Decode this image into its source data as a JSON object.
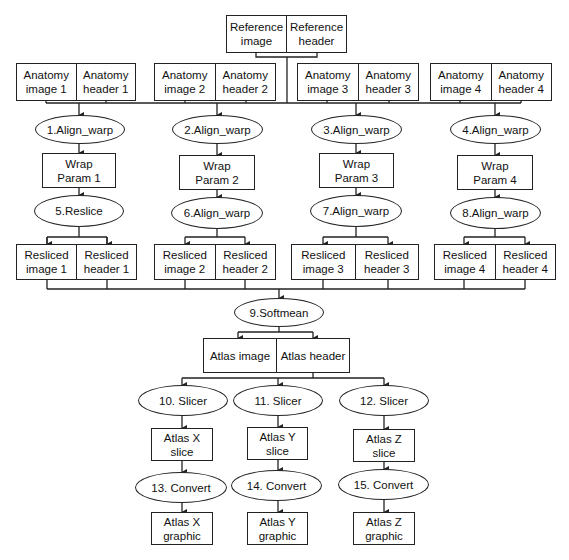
{
  "reference": {
    "image": "Reference\nimage",
    "header": "Reference\nheader"
  },
  "anatomy": [
    {
      "image": "Anatomy\nimage 1",
      "header": "Anatomy\nheader 1"
    },
    {
      "image": "Anatomy\nimage 2",
      "header": "Anatomy\nheader 2"
    },
    {
      "image": "Anatomy\nimage 3",
      "header": "Anatomy\nheader 3"
    },
    {
      "image": "Anatomy\nimage 4",
      "header": "Anatomy\nheader 4"
    }
  ],
  "align_warp": [
    "1.Align_warp",
    "2.Align_warp",
    "3.Align_warp",
    "4.Align_warp"
  ],
  "wrap_params": [
    "Wrap\nParam 1",
    "Wrap\nParam 2",
    "Wrap\nParam 3",
    "Wrap\nParam 4"
  ],
  "second_stage": [
    "5.Reslice",
    "6.Align_warp",
    "7.Align_warp",
    "8.Align_warp"
  ],
  "resliced": [
    {
      "image": "Resliced\nimage 1",
      "header": "Resliced\nheader 1"
    },
    {
      "image": "Resliced\nimage 2",
      "header": "Resliced\nheader 2"
    },
    {
      "image": "Resliced\nimage 3",
      "header": "Resliced\nheader 3"
    },
    {
      "image": "Resliced\nimage 4",
      "header": "Resliced\nheader 4"
    }
  ],
  "softmean": "9.Softmean",
  "atlas": {
    "image": "Atlas image",
    "header": "Atlas header"
  },
  "slicers": [
    "10. Slicer",
    "11. Slicer",
    "12. Slicer"
  ],
  "slices": [
    "Atlas X\nslice",
    "Atlas Y\nslice",
    "Atlas Z\nslice"
  ],
  "converts": [
    "13. Convert",
    "14. Convert",
    "15. Convert"
  ],
  "graphics": [
    "Atlas X\ngraphic",
    "Atlas Y\ngraphic",
    "Atlas Z\ngraphic"
  ],
  "colors": {
    "line": "#222222",
    "background": "#ffffff"
  }
}
